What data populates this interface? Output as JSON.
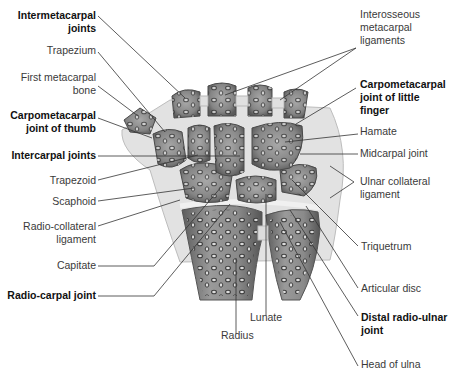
{
  "diagram": {
    "colors": {
      "bone_fill": "#8c8c8c",
      "bone_dark": "#5e5e5e",
      "cartilage": "#e6e6e6",
      "ligament": "#d4d4d4",
      "leader_line": "#333333",
      "label_text": "#3a3a3a",
      "bold_label_text": "#111111"
    },
    "labels_left": [
      {
        "id": "intermetacarpal-joints",
        "line1": "Intermetacarpal",
        "line2": "joints",
        "bold": true
      },
      {
        "id": "trapezium",
        "line1": "Trapezium",
        "line2": "",
        "bold": false
      },
      {
        "id": "first-metacarpal-bone",
        "line1": "First metacarpal",
        "line2": "bone",
        "bold": false
      },
      {
        "id": "carpometacarpal-joint-of-thumb",
        "line1": "Carpometacarpal",
        "line2": "joint of thumb",
        "bold": true
      },
      {
        "id": "intercarpal-joints",
        "line1": "Intercarpal joints",
        "line2": "",
        "bold": true
      },
      {
        "id": "trapezoid",
        "line1": "Trapezoid",
        "line2": "",
        "bold": false
      },
      {
        "id": "scaphoid",
        "line1": "Scaphoid",
        "line2": "",
        "bold": false
      },
      {
        "id": "radio-collateral-ligament",
        "line1": "Radio-collateral",
        "line2": "ligament",
        "bold": false
      },
      {
        "id": "capitate",
        "line1": "Capitate",
        "line2": "",
        "bold": false
      },
      {
        "id": "radio-carpal-joint",
        "line1": "Radio-carpal joint",
        "line2": "",
        "bold": true
      }
    ],
    "labels_right": [
      {
        "id": "interosseous-metacarpal-ligaments",
        "line1": "Interosseous",
        "line2": "metacarpal",
        "line3": "ligaments",
        "bold": false
      },
      {
        "id": "carpometacarpal-joint-of-little-finger",
        "line1": "Carpometacarpal",
        "line2": "joint of little",
        "line3": "finger",
        "bold": true
      },
      {
        "id": "hamate",
        "line1": "Hamate",
        "line2": "",
        "line3": "",
        "bold": false
      },
      {
        "id": "midcarpal-joint",
        "line1": "Midcarpal joint",
        "line2": "",
        "line3": "",
        "bold": false
      },
      {
        "id": "ulnar-collateral-ligament",
        "line1": "Ulnar collateral",
        "line2": "ligament",
        "line3": "",
        "bold": false
      },
      {
        "id": "triquetrum",
        "line1": "Triquetrum",
        "line2": "",
        "line3": "",
        "bold": false
      },
      {
        "id": "articular-disc",
        "line1": "Articular disc",
        "line2": "",
        "line3": "",
        "bold": false
      },
      {
        "id": "distal-radio-ulnar-joint",
        "line1": "Distal radio-ulnar",
        "line2": "joint",
        "line3": "",
        "bold": true
      },
      {
        "id": "head-of-ulna",
        "line1": "Head of ulna",
        "line2": "",
        "line3": "",
        "bold": false
      }
    ],
    "labels_bottom": [
      {
        "id": "lunate",
        "line1": "Lunate",
        "bold": false
      },
      {
        "id": "radius",
        "line1": "Radius",
        "bold": false
      }
    ]
  }
}
